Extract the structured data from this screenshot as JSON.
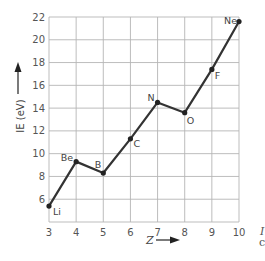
{
  "chart_data": {
    "type": "line",
    "title": "",
    "xlabel": "Z",
    "ylabel": "IE (eV)",
    "x": [
      3,
      4,
      5,
      6,
      7,
      8,
      9,
      10
    ],
    "series": [
      {
        "name": "First ionization energy",
        "values": [
          5.4,
          9.3,
          8.3,
          11.3,
          14.5,
          13.6,
          17.4,
          21.6
        ],
        "point_labels": [
          "Li",
          "Be",
          "B",
          "C",
          "N",
          "O",
          "F",
          "Ne"
        ]
      }
    ],
    "xticks": [
      "3",
      "4",
      "5",
      "6",
      "7",
      "8",
      "9",
      "10"
    ],
    "yticks": [
      "6",
      "8",
      "10",
      "12",
      "14",
      "16",
      "18",
      "20",
      "22"
    ],
    "xlim": [
      3,
      10
    ],
    "ylim": [
      4,
      22
    ],
    "grid": true,
    "legend": "none",
    "colors": {
      "line": "#333333",
      "grid": "#b5b5b5",
      "text": "#555555"
    }
  },
  "axes": {
    "y_title": "IE (eV)",
    "x_title": "Z"
  },
  "margin_fragments": [
    "I",
    "c"
  ]
}
